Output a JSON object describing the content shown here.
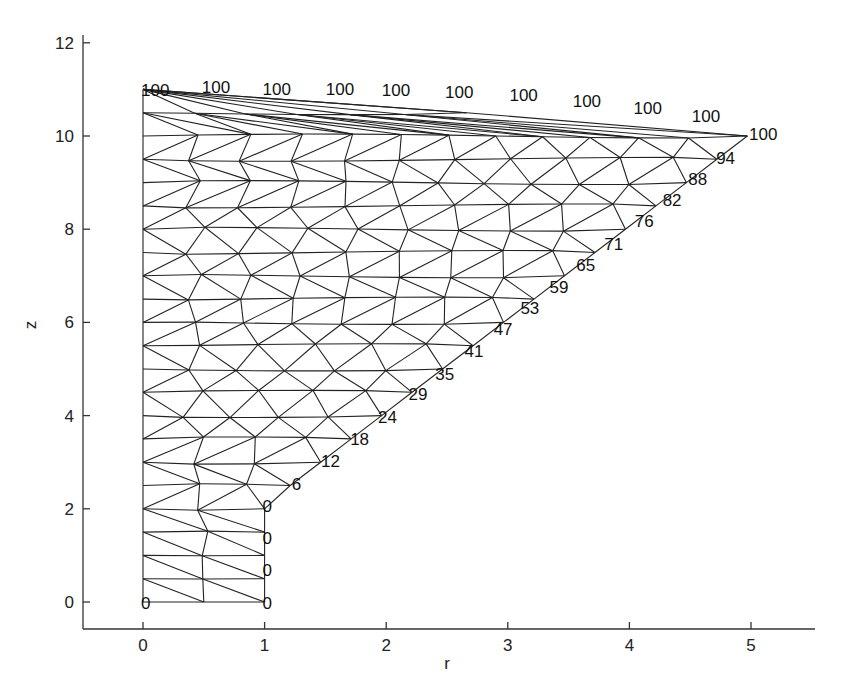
{
  "chart_data": {
    "type": "scatter",
    "subtype": "triangular-mesh",
    "title": "",
    "xlabel": "r",
    "ylabel": "z",
    "xlim": [
      -0.5,
      5.5
    ],
    "ylim": [
      -0.6,
      12.3
    ],
    "xticks": [
      0,
      1,
      2,
      3,
      4,
      5
    ],
    "yticks": [
      0,
      2,
      4,
      6,
      8,
      10,
      12
    ],
    "grid": false,
    "legend": null,
    "domain_outline": [
      [
        0,
        0
      ],
      [
        1,
        0
      ],
      [
        1,
        2.08
      ],
      [
        5,
        10.06
      ],
      [
        4.5,
        10.46
      ],
      [
        4.0,
        10.65
      ],
      [
        3.5,
        10.8
      ],
      [
        3.0,
        10.9
      ],
      [
        2.5,
        10.96
      ],
      [
        2.0,
        11.0
      ],
      [
        1.5,
        11.02
      ],
      [
        1.0,
        11.04
      ],
      [
        0.5,
        11.05
      ],
      [
        0,
        11.0
      ]
    ],
    "boundary_values": [
      {
        "r": 0.0,
        "z": 0.0,
        "label": "0"
      },
      {
        "r": 1.0,
        "z": 0.0,
        "label": "0"
      },
      {
        "r": 1.0,
        "z": 0.7,
        "label": "0"
      },
      {
        "r": 1.0,
        "z": 1.4,
        "label": "0"
      },
      {
        "r": 1.0,
        "z": 2.08,
        "label": "0"
      },
      {
        "r": 1.24,
        "z": 2.56,
        "label": "6"
      },
      {
        "r": 1.48,
        "z": 3.05,
        "label": "12"
      },
      {
        "r": 1.72,
        "z": 3.52,
        "label": "18"
      },
      {
        "r": 1.95,
        "z": 3.99,
        "label": "24"
      },
      {
        "r": 2.2,
        "z": 4.48,
        "label": "29"
      },
      {
        "r": 2.42,
        "z": 4.92,
        "label": "35"
      },
      {
        "r": 2.66,
        "z": 5.4,
        "label": "41"
      },
      {
        "r": 2.9,
        "z": 5.87,
        "label": "47"
      },
      {
        "r": 3.12,
        "z": 6.32,
        "label": "53"
      },
      {
        "r": 3.36,
        "z": 6.79,
        "label": "59"
      },
      {
        "r": 3.58,
        "z": 7.25,
        "label": "65"
      },
      {
        "r": 3.81,
        "z": 7.7,
        "label": "71"
      },
      {
        "r": 4.06,
        "z": 8.19,
        "label": "76"
      },
      {
        "r": 4.29,
        "z": 8.65,
        "label": "82"
      },
      {
        "r": 4.5,
        "z": 9.1,
        "label": "88"
      },
      {
        "r": 4.73,
        "z": 9.56,
        "label": "94"
      },
      {
        "r": 5.0,
        "z": 10.06,
        "label": "100"
      },
      {
        "r": 4.53,
        "z": 10.45,
        "label": "100"
      },
      {
        "r": 4.05,
        "z": 10.62,
        "label": "100"
      },
      {
        "r": 3.55,
        "z": 10.78,
        "label": "100"
      },
      {
        "r": 3.03,
        "z": 10.9,
        "label": "100"
      },
      {
        "r": 2.5,
        "z": 10.96,
        "label": "100"
      },
      {
        "r": 1.98,
        "z": 11.0,
        "label": "100"
      },
      {
        "r": 1.52,
        "z": 11.03,
        "label": "100"
      },
      {
        "r": 1.0,
        "z": 11.04,
        "label": "100"
      },
      {
        "r": 0.5,
        "z": 11.08,
        "label": "100"
      },
      {
        "r": 0.0,
        "z": 11.0,
        "label": "100"
      }
    ]
  },
  "axes": {
    "x_label": "r",
    "y_label": "z",
    "x_ticks": [
      "0",
      "1",
      "2",
      "3",
      "4",
      "5"
    ],
    "y_ticks": [
      "0",
      "2",
      "4",
      "6",
      "8",
      "10",
      "12"
    ]
  }
}
